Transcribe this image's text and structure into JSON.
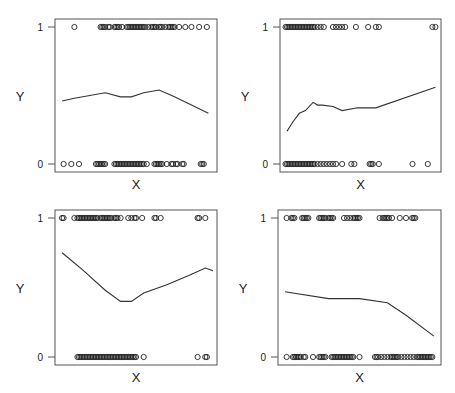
{
  "chart_data": [
    {
      "type": "scatter",
      "title": "",
      "xlabel": "X",
      "ylabel": "Y",
      "yticks": [
        "0",
        "1"
      ],
      "ylim": [
        0,
        1
      ],
      "frame": {
        "x": 55,
        "y": 19,
        "w": 162,
        "h": 153
      },
      "points_y1": [
        0.1,
        0.27,
        0.28,
        0.29,
        0.3,
        0.32,
        0.33,
        0.36,
        0.37,
        0.38,
        0.39,
        0.41,
        0.44,
        0.45,
        0.46,
        0.47,
        0.48,
        0.49,
        0.5,
        0.51,
        0.52,
        0.53,
        0.54,
        0.55,
        0.56,
        0.58,
        0.6,
        0.61,
        0.62,
        0.63,
        0.65,
        0.66,
        0.67,
        0.69,
        0.71,
        0.72,
        0.73,
        0.74,
        0.75,
        0.78,
        0.82,
        0.86,
        0.91,
        0.96
      ],
      "points_y0": [
        0.03,
        0.08,
        0.13,
        0.24,
        0.25,
        0.26,
        0.27,
        0.28,
        0.29,
        0.3,
        0.36,
        0.37,
        0.38,
        0.39,
        0.4,
        0.41,
        0.42,
        0.43,
        0.44,
        0.45,
        0.46,
        0.47,
        0.48,
        0.49,
        0.5,
        0.51,
        0.52,
        0.53,
        0.54,
        0.55,
        0.57,
        0.62,
        0.63,
        0.64,
        0.65,
        0.66,
        0.67,
        0.7,
        0.73,
        0.74,
        0.76,
        0.77,
        0.8,
        0.81,
        0.92,
        0.93,
        0.94
      ],
      "curve": [
        [
          0.02,
          0.46
        ],
        [
          0.1,
          0.48
        ],
        [
          0.3,
          0.52
        ],
        [
          0.4,
          0.49
        ],
        [
          0.47,
          0.49
        ],
        [
          0.55,
          0.52
        ],
        [
          0.65,
          0.54
        ],
        [
          0.75,
          0.49
        ],
        [
          0.97,
          0.37
        ]
      ]
    },
    {
      "type": "scatter",
      "title": "",
      "xlabel": "X",
      "ylabel": "Y",
      "yticks": [
        "0",
        "1"
      ],
      "ylim": [
        0,
        1
      ],
      "frame": {
        "x": 280,
        "y": 19,
        "w": 161,
        "h": 153
      },
      "points_y1": [
        0.01,
        0.02,
        0.03,
        0.04,
        0.05,
        0.06,
        0.07,
        0.08,
        0.09,
        0.1,
        0.11,
        0.12,
        0.13,
        0.14,
        0.15,
        0.16,
        0.17,
        0.18,
        0.19,
        0.2,
        0.22,
        0.24,
        0.26,
        0.32,
        0.34,
        0.36,
        0.38,
        0.4,
        0.47,
        0.55,
        0.6,
        0.62,
        0.97,
        0.99
      ],
      "points_y0": [
        0.01,
        0.02,
        0.03,
        0.04,
        0.05,
        0.06,
        0.07,
        0.08,
        0.09,
        0.1,
        0.11,
        0.12,
        0.13,
        0.14,
        0.15,
        0.16,
        0.17,
        0.18,
        0.19,
        0.2,
        0.22,
        0.24,
        0.26,
        0.28,
        0.3,
        0.32,
        0.34,
        0.38,
        0.44,
        0.46,
        0.56,
        0.57,
        0.58,
        0.62,
        0.84,
        0.94
      ],
      "curve": [
        [
          0.02,
          0.24
        ],
        [
          0.06,
          0.31
        ],
        [
          0.1,
          0.37
        ],
        [
          0.14,
          0.39
        ],
        [
          0.19,
          0.45
        ],
        [
          0.22,
          0.43
        ],
        [
          0.25,
          0.43
        ],
        [
          0.32,
          0.42
        ],
        [
          0.38,
          0.39
        ],
        [
          0.48,
          0.41
        ],
        [
          0.6,
          0.41
        ],
        [
          0.99,
          0.56
        ]
      ]
    },
    {
      "type": "scatter",
      "title": "",
      "xlabel": "X",
      "ylabel": "Y",
      "yticks": [
        "0",
        "1"
      ],
      "ylim": [
        0,
        1
      ],
      "frame": {
        "x": 55,
        "y": 210,
        "w": 162,
        "h": 155
      },
      "points_y1": [
        0.02,
        0.03,
        0.1,
        0.12,
        0.13,
        0.14,
        0.15,
        0.16,
        0.17,
        0.18,
        0.19,
        0.2,
        0.21,
        0.22,
        0.23,
        0.24,
        0.25,
        0.27,
        0.28,
        0.29,
        0.3,
        0.31,
        0.32,
        0.33,
        0.34,
        0.36,
        0.37,
        0.38,
        0.4,
        0.45,
        0.47,
        0.49,
        0.5,
        0.54,
        0.62,
        0.63,
        0.66,
        0.9,
        0.91,
        0.95
      ],
      "points_y0": [
        0.12,
        0.13,
        0.14,
        0.15,
        0.16,
        0.17,
        0.18,
        0.19,
        0.2,
        0.21,
        0.22,
        0.23,
        0.24,
        0.25,
        0.26,
        0.27,
        0.28,
        0.29,
        0.3,
        0.31,
        0.32,
        0.33,
        0.34,
        0.35,
        0.36,
        0.37,
        0.38,
        0.39,
        0.4,
        0.41,
        0.42,
        0.43,
        0.44,
        0.45,
        0.46,
        0.47,
        0.48,
        0.49,
        0.5,
        0.55,
        0.9,
        0.95,
        0.96
      ],
      "curve": [
        [
          0.02,
          0.75
        ],
        [
          0.15,
          0.63
        ],
        [
          0.3,
          0.48
        ],
        [
          0.4,
          0.4
        ],
        [
          0.47,
          0.4
        ],
        [
          0.55,
          0.46
        ],
        [
          0.7,
          0.52
        ],
        [
          0.85,
          0.59
        ],
        [
          0.95,
          0.64
        ],
        [
          1.0,
          0.62
        ]
      ]
    },
    {
      "type": "scatter",
      "title": "",
      "xlabel": "X",
      "ylabel": "Y",
      "yticks": [
        "0",
        "1"
      ],
      "ylim": [
        0,
        1
      ],
      "frame": {
        "x": 278,
        "y": 210,
        "w": 163,
        "h": 155
      },
      "points_y1": [
        0.03,
        0.06,
        0.07,
        0.08,
        0.13,
        0.14,
        0.15,
        0.16,
        0.17,
        0.24,
        0.25,
        0.26,
        0.27,
        0.28,
        0.3,
        0.31,
        0.32,
        0.33,
        0.4,
        0.42,
        0.44,
        0.46,
        0.47,
        0.48,
        0.49,
        0.5,
        0.63,
        0.65,
        0.66,
        0.67,
        0.68,
        0.69,
        0.71,
        0.76,
        0.8,
        0.84,
        0.85,
        0.86
      ],
      "points_y0": [
        0.03,
        0.07,
        0.08,
        0.09,
        0.1,
        0.11,
        0.12,
        0.14,
        0.15,
        0.2,
        0.24,
        0.25,
        0.26,
        0.27,
        0.28,
        0.32,
        0.33,
        0.34,
        0.35,
        0.36,
        0.37,
        0.38,
        0.39,
        0.4,
        0.41,
        0.42,
        0.43,
        0.44,
        0.45,
        0.46,
        0.5,
        0.6,
        0.61,
        0.62,
        0.64,
        0.66,
        0.68,
        0.7,
        0.71,
        0.72,
        0.73,
        0.74,
        0.75,
        0.77,
        0.79,
        0.81,
        0.83,
        0.85,
        0.87,
        0.88,
        0.89,
        0.9,
        0.91,
        0.92,
        0.93,
        0.94,
        0.95,
        0.96,
        0.97
      ],
      "curve": [
        [
          0.02,
          0.47
        ],
        [
          0.3,
          0.42
        ],
        [
          0.5,
          0.42
        ],
        [
          0.68,
          0.39
        ],
        [
          0.8,
          0.3
        ],
        [
          0.98,
          0.15
        ]
      ]
    }
  ]
}
